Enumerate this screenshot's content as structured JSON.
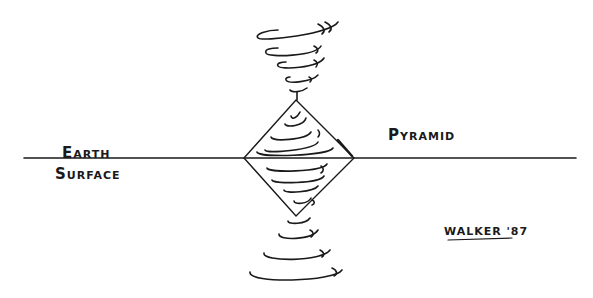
{
  "labels": {
    "earth_line1": "E",
    "earth_line1_rest": "ARTH",
    "surface_first": "S",
    "surface_rest": "URFACE",
    "pyramid_first": "P",
    "pyramid_rest": "YRAMID",
    "signature": "WALKER '87"
  },
  "diagram": {
    "ground_line": {
      "x1": 24,
      "x2": 576,
      "y": 158
    },
    "pyramid": {
      "top": [
        296,
        100
      ],
      "left": [
        244,
        158
      ],
      "right": [
        354,
        158
      ],
      "bottom": [
        296,
        216
      ]
    },
    "stroke_color": "#1a1a1a"
  }
}
